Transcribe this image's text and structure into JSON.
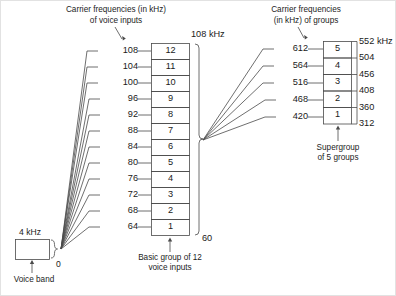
{
  "diagram": {
    "stroke_color": "#4a4a4a",
    "text_color": "#1a1a1a"
  },
  "voice_band": {
    "top_label": "4 kHz",
    "bottom_label": "0",
    "caption": "Voice band"
  },
  "group": {
    "header_line1": "Carrier frequencies (in kHz)",
    "header_line2": "of voice inputs",
    "top_edge_label": "108 kHz",
    "bottom_edge_label": "60",
    "caption_line1": "Basic group of 12",
    "caption_line2": "voice inputs",
    "channels": [
      {
        "index": "12",
        "carrier": "108"
      },
      {
        "index": "11",
        "carrier": "104"
      },
      {
        "index": "10",
        "carrier": "100"
      },
      {
        "index": "9",
        "carrier": "96"
      },
      {
        "index": "8",
        "carrier": "92"
      },
      {
        "index": "7",
        "carrier": "88"
      },
      {
        "index": "6",
        "carrier": "84"
      },
      {
        "index": "5",
        "carrier": "80"
      },
      {
        "index": "4",
        "carrier": "76"
      },
      {
        "index": "3",
        "carrier": "72"
      },
      {
        "index": "2",
        "carrier": "68"
      },
      {
        "index": "1",
        "carrier": "64"
      }
    ]
  },
  "supergroup": {
    "header_line1": "Carrier frequencies",
    "header_line2": "(in kHz) of groups",
    "caption_line1": "Supergroup",
    "caption_line2": "of 5 groups",
    "groups": [
      {
        "index": "5",
        "carrier": "612"
      },
      {
        "index": "4",
        "carrier": "564"
      },
      {
        "index": "3",
        "carrier": "516"
      },
      {
        "index": "2",
        "carrier": "468"
      },
      {
        "index": "1",
        "carrier": "420"
      }
    ],
    "band_edges": [
      "552 kHz",
      "504",
      "456",
      "408",
      "360",
      "312"
    ]
  }
}
